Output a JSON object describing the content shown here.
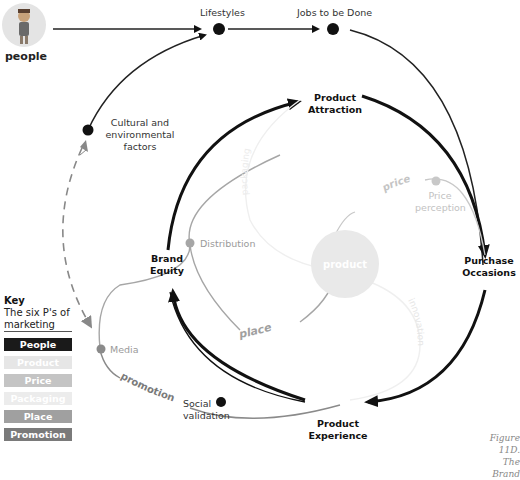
{
  "diagram": {
    "people_label": "people",
    "nodes": {
      "lifestyles": "Lifestyles",
      "jobs_to_be_done": "Jobs to be Done",
      "cultural_factors": [
        "Cultural and",
        "environmental",
        "factors"
      ],
      "product_attraction": [
        "Product",
        "Attraction"
      ],
      "purchase_occasions": [
        "Purchase",
        "Occasions"
      ],
      "product_experience": [
        "Product",
        "Experience"
      ],
      "brand_equity": [
        "Brand",
        "Equity"
      ],
      "distribution": "Distribution",
      "price_perception": [
        "Price",
        "perception"
      ],
      "media": "Media",
      "social_validation": [
        "Social",
        "validation"
      ],
      "product_center": "product"
    },
    "arc_labels": {
      "price": "price",
      "place": "place",
      "promotion": "promotion",
      "packaging": "packaging",
      "innovation": "innovation"
    }
  },
  "key": {
    "title": "Key",
    "subtitle": "The six P's of marketing",
    "items": [
      {
        "label": "People",
        "color": "#1a1a1a"
      },
      {
        "label": "Product",
        "color": "#e6e6e6"
      },
      {
        "label": "Price",
        "color": "#c4c4c4"
      },
      {
        "label": "Packaging",
        "color": "#ececec"
      },
      {
        "label": "Place",
        "color": "#a0a0a0"
      },
      {
        "label": "Promotion",
        "color": "#7a7a7a"
      }
    ]
  },
  "caption": [
    "Figure 11D.",
    "The Brand"
  ]
}
